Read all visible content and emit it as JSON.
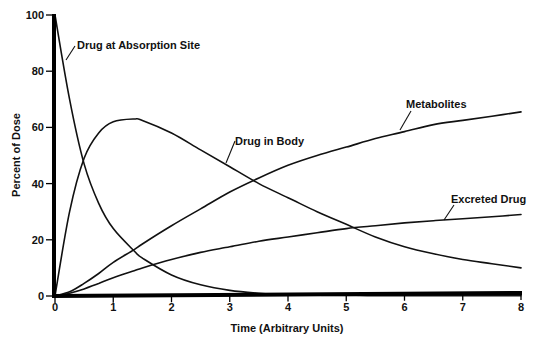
{
  "chart_data": {
    "type": "line",
    "title": "",
    "xlabel": "Time (Arbitrary Units)",
    "ylabel": "Percent of Dose",
    "xlim": [
      0,
      8
    ],
    "ylim": [
      0,
      100
    ],
    "x_ticks": [
      0,
      1,
      2,
      3,
      4,
      5,
      6,
      7,
      8
    ],
    "y_ticks": [
      0,
      20,
      40,
      60,
      80,
      100
    ],
    "grid": false,
    "legend": "inline labels with leader lines",
    "x": [
      0,
      0.25,
      0.5,
      0.75,
      1,
      1.36,
      1.5,
      2,
      2.5,
      3,
      3.5,
      4,
      4.5,
      5,
      5.5,
      6,
      6.5,
      7,
      7.5,
      8
    ],
    "series": [
      {
        "name": "Drug at Absorption Site",
        "values": [
          100,
          70,
          47,
          33,
          24,
          16,
          13.5,
          7.5,
          4,
          2,
          1,
          0.5,
          0.3,
          0.2,
          0.1,
          0.1,
          0.1,
          0.1,
          0.1,
          0.1
        ]
      },
      {
        "name": "Drug in Body",
        "values": [
          0,
          30,
          49,
          58,
          62,
          63,
          62.5,
          58,
          52,
          46,
          40,
          35,
          30,
          25.5,
          21,
          17.5,
          15,
          13,
          11.5,
          10
        ]
      },
      {
        "name": "Metabolites",
        "values": [
          0,
          1.5,
          4.5,
          8,
          12,
          16.5,
          18.5,
          25,
          31,
          37,
          42,
          46.5,
          50,
          53,
          56,
          58.5,
          61,
          62.5,
          64,
          65.5
        ]
      },
      {
        "name": "Excreted Drug",
        "values": [
          0,
          1,
          2.5,
          4.5,
          6.5,
          9,
          10,
          13,
          15.5,
          17.5,
          19.5,
          21,
          22.5,
          24,
          25,
          26,
          26.8,
          27.5,
          28.2,
          29
        ]
      }
    ]
  },
  "labels": {
    "absorption": "Drug at Absorption Site",
    "body": "Drug in Body",
    "metabolites": "Metabolites",
    "excreted": "Excreted Drug"
  },
  "axes": {
    "x_title": "Time (Arbitrary Units)",
    "y_title": "Percent of Dose"
  }
}
